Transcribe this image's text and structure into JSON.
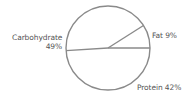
{
  "chart_data": {
    "type": "pie",
    "title": "",
    "categories": [
      "Fat",
      "Protein",
      "Carbohydrate"
    ],
    "values": [
      9,
      42,
      49
    ],
    "unit": "%",
    "labels": [
      {
        "name": "Fat",
        "text": "Fat 9%"
      },
      {
        "name": "Protein",
        "text": "Protein 42%"
      },
      {
        "name": "Carbohydrate",
        "line1": "Carbohydrate",
        "line2": "49%"
      }
    ],
    "fill": "none",
    "stroke_color": "#8a8a8a",
    "text_color": "#555555",
    "legend": "none (direct labels)"
  }
}
